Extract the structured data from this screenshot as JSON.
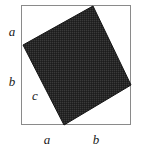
{
  "figure": {
    "background_color": "#ffffff",
    "outer_square": {
      "name": "outer-square",
      "stroke_color": "#888888",
      "fill_color": "#ffffff",
      "stroke_width": 1,
      "left": 21,
      "top": 5,
      "right": 131,
      "bottom": 125,
      "width": 110,
      "height": 120
    },
    "inner_square": {
      "name": "inner-tilted-square",
      "fill_color": "#2b2b2b",
      "stroke_color": "#111111",
      "stroke_width": 1,
      "vertices": [
        {
          "label": "top",
          "x": 93,
          "y": 6
        },
        {
          "label": "right",
          "x": 131,
          "y": 85
        },
        {
          "label": "bottom",
          "x": 64,
          "y": 125
        },
        {
          "label": "left",
          "x": 23,
          "y": 45
        }
      ]
    },
    "labels": [
      {
        "id": "label-a-left",
        "text": "a",
        "x": 12,
        "y": 31,
        "side": "left-upper"
      },
      {
        "id": "label-b-left",
        "text": "b",
        "x": 12,
        "y": 81,
        "side": "left-lower"
      },
      {
        "id": "label-c-hyp",
        "text": "c",
        "x": 35,
        "y": 95,
        "side": "interior-hypotenuse"
      },
      {
        "id": "label-a-bottom",
        "text": "a",
        "x": 47,
        "y": 139,
        "side": "bottom-left"
      },
      {
        "id": "label-b-bottom",
        "text": "b",
        "x": 96,
        "y": 139,
        "side": "bottom-right"
      }
    ]
  }
}
